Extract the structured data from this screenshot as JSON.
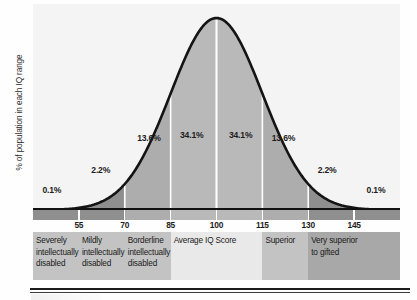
{
  "figure": {
    "ylabel": "% of population in each IQ range"
  },
  "colors": {
    "curve_stroke": "#141414",
    "panel_bg": "#f4f4f4",
    "fill_center": "#b9b9b9",
    "fill_mid": "#adadad",
    "fill_outer": "#8f8f8f",
    "divider": "#ffffff",
    "text": "#1d1d1d",
    "band_light": "#e9e9e9",
    "band_mid": "#c3c3c3",
    "band_dark": "#a8a8a8"
  },
  "chart_data": {
    "type": "area",
    "title": "",
    "subtitle": "",
    "xlabel": "",
    "ylabel": "% of population in each IQ range",
    "grid": false,
    "legend_position": "none",
    "distribution": {
      "kind": "normal",
      "mean": 100,
      "std_dev": 15
    },
    "xlim": [
      40,
      160
    ],
    "ylim": [
      0,
      2.8
    ],
    "x_ticks": [
      55,
      70,
      85,
      100,
      115,
      130,
      145
    ],
    "x_tick_labels": [
      "55",
      "70",
      "85",
      "100",
      "115",
      "130",
      "145"
    ],
    "sd_dividers": [
      55,
      70,
      85,
      100,
      115,
      130,
      145
    ],
    "bins": [
      {
        "range": [
          40,
          55
        ],
        "label": "0.1%",
        "value": 0.1,
        "annotation_x": 47,
        "annotation_y": 0.3
      },
      {
        "range": [
          55,
          70
        ],
        "label": "2.2%",
        "value": 2.2,
        "annotation_x": 63,
        "annotation_y": 0.62
      },
      {
        "range": [
          70,
          85
        ],
        "label": "13.6%",
        "value": 13.6,
        "annotation_x": 78,
        "annotation_y": 1.12
      },
      {
        "range": [
          85,
          100
        ],
        "label": "34.1%",
        "value": 34.1,
        "annotation_x": 92,
        "annotation_y": 1.18
      },
      {
        "range": [
          100,
          115
        ],
        "label": "34.1%",
        "value": 34.1,
        "annotation_x": 108,
        "annotation_y": 1.18
      },
      {
        "range": [
          115,
          130
        ],
        "label": "13.6%",
        "value": 13.6,
        "annotation_x": 122,
        "annotation_y": 1.12
      },
      {
        "range": [
          130,
          145
        ],
        "label": "2.2%",
        "value": 2.2,
        "annotation_x": 137,
        "annotation_y": 0.62
      },
      {
        "range": [
          145,
          160
        ],
        "label": "0.1%",
        "value": 0.1,
        "annotation_x": 153,
        "annotation_y": 0.3
      }
    ],
    "annotations": [
      "0.1%",
      "2.2%",
      "13.6%",
      "34.1%",
      "34.1%",
      "13.6%",
      "2.2%",
      "0.1%"
    ],
    "categories": [
      {
        "name": "Severely intellectually disabled",
        "lines": [
          "Severely",
          "intellectually",
          "disabled"
        ],
        "range": [
          40,
          55
        ],
        "shade": "band_mid"
      },
      {
        "name": "Mildly intellectually disabled",
        "lines": [
          "Mildly",
          "intellectually",
          "disabled"
        ],
        "range": [
          55,
          70
        ],
        "shade": "band_mid"
      },
      {
        "name": "Borderline intellectually disabled",
        "lines": [
          "Borderline",
          "intellectually",
          "disabled"
        ],
        "range": [
          70,
          85
        ],
        "shade": "band_mid"
      },
      {
        "name": "Average IQ Score",
        "lines": [
          "Average IQ Score"
        ],
        "range": [
          85,
          115
        ],
        "shade": "band_light"
      },
      {
        "name": "Superior",
        "lines": [
          "Superior"
        ],
        "range": [
          115,
          130
        ],
        "shade": "band_mid"
      },
      {
        "name": "Very superior to gifted",
        "lines": [
          "Very superior",
          "to gifted"
        ],
        "range": [
          130,
          160
        ],
        "shade": "band_dark"
      }
    ]
  }
}
